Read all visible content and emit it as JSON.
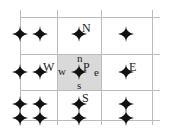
{
  "diagram": {
    "colors": {
      "grid": "#bbbbbb",
      "cell_fill": "#d9d9d9",
      "node": "#111111"
    },
    "grid": {
      "v_lines": [
        20,
        57,
        101,
        152
      ],
      "h_lines": [
        17,
        54,
        90,
        120
      ],
      "x_range": [
        20,
        160
      ],
      "y_range": [
        10,
        125
      ]
    },
    "control_volume": {
      "x": 57,
      "y": 54,
      "w": 44,
      "h": 37
    },
    "nodes": [
      {
        "x": 20,
        "y": 34
      },
      {
        "x": 40,
        "y": 34
      },
      {
        "x": 79,
        "y": 34
      },
      {
        "x": 126,
        "y": 34
      },
      {
        "x": 20,
        "y": 72
      },
      {
        "x": 40,
        "y": 72
      },
      {
        "x": 79,
        "y": 72
      },
      {
        "x": 126,
        "y": 72
      },
      {
        "x": 20,
        "y": 104
      },
      {
        "x": 40,
        "y": 104
      },
      {
        "x": 79,
        "y": 104
      },
      {
        "x": 126,
        "y": 104
      },
      {
        "x": 20,
        "y": 118
      },
      {
        "x": 40,
        "y": 118
      },
      {
        "x": 79,
        "y": 118
      },
      {
        "x": 126,
        "y": 118
      }
    ],
    "labels": {
      "N": "N",
      "S": "S",
      "E": "E",
      "W": "W",
      "P": "P",
      "n": "n",
      "s": "s",
      "e": "e",
      "w": "w"
    }
  }
}
